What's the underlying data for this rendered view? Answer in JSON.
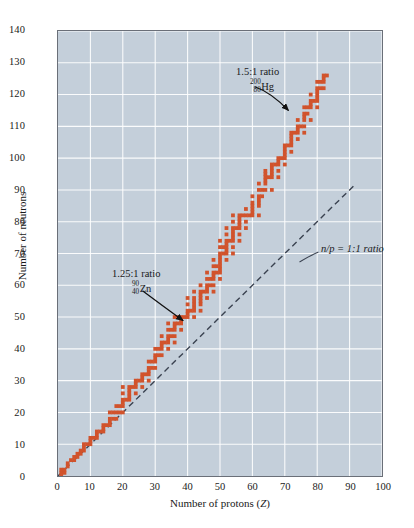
{
  "chart_data": {
    "type": "scatter",
    "title": "",
    "xlabel": "Number of protons (Z)",
    "ylabel": "Number of neutrons",
    "xlim": [
      0,
      100
    ],
    "ylim": [
      0,
      140
    ],
    "xticks": [
      0,
      10,
      20,
      30,
      40,
      50,
      60,
      70,
      80,
      90,
      100
    ],
    "yticks": [
      0,
      10,
      20,
      30,
      40,
      50,
      60,
      70,
      80,
      90,
      100,
      110,
      120,
      130,
      140
    ],
    "grid": true,
    "grid_color": "#ffffff",
    "plot_background": "#c4cfda",
    "marker_color": "#d1532c",
    "legend": "none",
    "series": [
      {
        "name": "Stable nuclides (band of stability)",
        "marker": "square",
        "color": "#d1532c",
        "points": [
          [
            1,
            0
          ],
          [
            1,
            1
          ],
          [
            1,
            2
          ],
          [
            2,
            1
          ],
          [
            2,
            2
          ],
          [
            3,
            3
          ],
          [
            3,
            4
          ],
          [
            4,
            5
          ],
          [
            5,
            5
          ],
          [
            5,
            6
          ],
          [
            6,
            6
          ],
          [
            6,
            7
          ],
          [
            7,
            7
          ],
          [
            7,
            8
          ],
          [
            8,
            8
          ],
          [
            8,
            9
          ],
          [
            8,
            10
          ],
          [
            9,
            10
          ],
          [
            10,
            10
          ],
          [
            10,
            11
          ],
          [
            10,
            12
          ],
          [
            11,
            12
          ],
          [
            12,
            12
          ],
          [
            12,
            13
          ],
          [
            12,
            14
          ],
          [
            13,
            14
          ],
          [
            14,
            14
          ],
          [
            14,
            15
          ],
          [
            14,
            16
          ],
          [
            15,
            16
          ],
          [
            16,
            16
          ],
          [
            16,
            17
          ],
          [
            16,
            18
          ],
          [
            16,
            20
          ],
          [
            17,
            18
          ],
          [
            17,
            20
          ],
          [
            18,
            18
          ],
          [
            18,
            20
          ],
          [
            18,
            22
          ],
          [
            19,
            20
          ],
          [
            19,
            22
          ],
          [
            20,
            20
          ],
          [
            20,
            22
          ],
          [
            20,
            23
          ],
          [
            20,
            24
          ],
          [
            20,
            26
          ],
          [
            20,
            28
          ],
          [
            21,
            24
          ],
          [
            22,
            24
          ],
          [
            22,
            25
          ],
          [
            22,
            26
          ],
          [
            22,
            27
          ],
          [
            22,
            28
          ],
          [
            23,
            28
          ],
          [
            24,
            26
          ],
          [
            24,
            28
          ],
          [
            24,
            29
          ],
          [
            24,
            30
          ],
          [
            25,
            30
          ],
          [
            26,
            28
          ],
          [
            26,
            30
          ],
          [
            26,
            31
          ],
          [
            26,
            32
          ],
          [
            27,
            32
          ],
          [
            28,
            30
          ],
          [
            28,
            32
          ],
          [
            28,
            33
          ],
          [
            28,
            34
          ],
          [
            28,
            36
          ],
          [
            29,
            34
          ],
          [
            29,
            36
          ],
          [
            30,
            34
          ],
          [
            30,
            36
          ],
          [
            30,
            37
          ],
          [
            30,
            38
          ],
          [
            30,
            40
          ],
          [
            31,
            38
          ],
          [
            31,
            40
          ],
          [
            32,
            38
          ],
          [
            32,
            40
          ],
          [
            32,
            41
          ],
          [
            32,
            42
          ],
          [
            32,
            44
          ],
          [
            33,
            42
          ],
          [
            34,
            40
          ],
          [
            34,
            42
          ],
          [
            34,
            43
          ],
          [
            34,
            44
          ],
          [
            34,
            46
          ],
          [
            34,
            48
          ],
          [
            35,
            44
          ],
          [
            35,
            46
          ],
          [
            36,
            42
          ],
          [
            36,
            44
          ],
          [
            36,
            46
          ],
          [
            36,
            47
          ],
          [
            36,
            48
          ],
          [
            36,
            50
          ],
          [
            37,
            48
          ],
          [
            37,
            50
          ],
          [
            38,
            46
          ],
          [
            38,
            48
          ],
          [
            38,
            49
          ],
          [
            38,
            50
          ],
          [
            39,
            50
          ],
          [
            40,
            50
          ],
          [
            40,
            51
          ],
          [
            40,
            52
          ],
          [
            40,
            54
          ],
          [
            40,
            56
          ],
          [
            41,
            52
          ],
          [
            42,
            50
          ],
          [
            42,
            52
          ],
          [
            42,
            53
          ],
          [
            42,
            54
          ],
          [
            42,
            55
          ],
          [
            42,
            56
          ],
          [
            42,
            58
          ],
          [
            44,
            52
          ],
          [
            44,
            54
          ],
          [
            44,
            55
          ],
          [
            44,
            56
          ],
          [
            44,
            57
          ],
          [
            44,
            58
          ],
          [
            44,
            60
          ],
          [
            45,
            58
          ],
          [
            46,
            56
          ],
          [
            46,
            58
          ],
          [
            46,
            59
          ],
          [
            46,
            60
          ],
          [
            46,
            62
          ],
          [
            46,
            64
          ],
          [
            47,
            60
          ],
          [
            47,
            62
          ],
          [
            48,
            58
          ],
          [
            48,
            60
          ],
          [
            48,
            62
          ],
          [
            48,
            63
          ],
          [
            48,
            64
          ],
          [
            48,
            66
          ],
          [
            48,
            68
          ],
          [
            49,
            64
          ],
          [
            49,
            66
          ],
          [
            50,
            62
          ],
          [
            50,
            64
          ],
          [
            50,
            65
          ],
          [
            50,
            66
          ],
          [
            50,
            67
          ],
          [
            50,
            68
          ],
          [
            50,
            69
          ],
          [
            50,
            70
          ],
          [
            50,
            72
          ],
          [
            50,
            74
          ],
          [
            51,
            70
          ],
          [
            51,
            72
          ],
          [
            52,
            68
          ],
          [
            52,
            70
          ],
          [
            52,
            71
          ],
          [
            52,
            72
          ],
          [
            52,
            73
          ],
          [
            52,
            74
          ],
          [
            52,
            76
          ],
          [
            52,
            78
          ],
          [
            53,
            74
          ],
          [
            54,
            70
          ],
          [
            54,
            72
          ],
          [
            54,
            74
          ],
          [
            54,
            75
          ],
          [
            54,
            76
          ],
          [
            54,
            77
          ],
          [
            54,
            78
          ],
          [
            54,
            80
          ],
          [
            54,
            82
          ],
          [
            55,
            78
          ],
          [
            56,
            74
          ],
          [
            56,
            76
          ],
          [
            56,
            78
          ],
          [
            56,
            79
          ],
          [
            56,
            80
          ],
          [
            56,
            81
          ],
          [
            56,
            82
          ],
          [
            57,
            82
          ],
          [
            58,
            78
          ],
          [
            58,
            80
          ],
          [
            58,
            82
          ],
          [
            58,
            84
          ],
          [
            59,
            82
          ],
          [
            60,
            82
          ],
          [
            60,
            83
          ],
          [
            60,
            84
          ],
          [
            60,
            85
          ],
          [
            60,
            86
          ],
          [
            60,
            88
          ],
          [
            62,
            82
          ],
          [
            62,
            85
          ],
          [
            62,
            86
          ],
          [
            62,
            87
          ],
          [
            62,
            88
          ],
          [
            62,
            90
          ],
          [
            62,
            92
          ],
          [
            63,
            88
          ],
          [
            63,
            90
          ],
          [
            64,
            90
          ],
          [
            64,
            92
          ],
          [
            64,
            93
          ],
          [
            64,
            94
          ],
          [
            64,
            95
          ],
          [
            64,
            96
          ],
          [
            65,
            94
          ],
          [
            66,
            90
          ],
          [
            66,
            94
          ],
          [
            66,
            95
          ],
          [
            66,
            96
          ],
          [
            66,
            97
          ],
          [
            66,
            98
          ],
          [
            67,
            98
          ],
          [
            68,
            94
          ],
          [
            68,
            96
          ],
          [
            68,
            98
          ],
          [
            68,
            99
          ],
          [
            68,
            100
          ],
          [
            69,
            100
          ],
          [
            70,
            98
          ],
          [
            70,
            100
          ],
          [
            70,
            101
          ],
          [
            70,
            102
          ],
          [
            70,
            103
          ],
          [
            70,
            104
          ],
          [
            71,
            104
          ],
          [
            72,
            102
          ],
          [
            72,
            104
          ],
          [
            72,
            105
          ],
          [
            72,
            106
          ],
          [
            72,
            107
          ],
          [
            72,
            108
          ],
          [
            73,
            108
          ],
          [
            74,
            106
          ],
          [
            74,
            108
          ],
          [
            74,
            109
          ],
          [
            74,
            110
          ],
          [
            74,
            112
          ],
          [
            75,
            110
          ],
          [
            76,
            108
          ],
          [
            76,
            110
          ],
          [
            76,
            112
          ],
          [
            76,
            113
          ],
          [
            76,
            114
          ],
          [
            76,
            116
          ],
          [
            77,
            114
          ],
          [
            77,
            116
          ],
          [
            78,
            112
          ],
          [
            78,
            116
          ],
          [
            78,
            117
          ],
          [
            78,
            118
          ],
          [
            78,
            120
          ],
          [
            79,
            118
          ],
          [
            80,
            116
          ],
          [
            80,
            118
          ],
          [
            80,
            119
          ],
          [
            80,
            120
          ],
          [
            80,
            121
          ],
          [
            80,
            122
          ],
          [
            80,
            124
          ],
          [
            81,
            122
          ],
          [
            81,
            124
          ],
          [
            82,
            122
          ],
          [
            82,
            124
          ],
          [
            82,
            125
          ],
          [
            82,
            126
          ],
          [
            83,
            126
          ]
        ]
      }
    ],
    "reference_line": {
      "name": "n/p = 1:1 ratio",
      "style": "dashed",
      "color": "#3a4250",
      "from": [
        0,
        0
      ],
      "to": [
        92,
        92
      ]
    },
    "annotations": [
      {
        "id": "hg",
        "ratio_label": "1.5:1 ratio",
        "mass_number": "200",
        "atomic_number": "80",
        "symbol": "Hg",
        "target_point": [
          80,
          120
        ]
      },
      {
        "id": "zn",
        "ratio_label": "1.25:1 ratio",
        "mass_number": "90",
        "atomic_number": "40",
        "symbol": "Zn",
        "target_point": [
          40,
          50
        ]
      },
      {
        "id": "np",
        "label_italic_part": "n/p",
        "label_rest": " = 1:1 ratio"
      }
    ]
  },
  "axes": {
    "y_title": "Number of neutrons",
    "x_title_prefix": "Number of protons (",
    "x_title_italic": "Z",
    "x_title_suffix": ")"
  }
}
